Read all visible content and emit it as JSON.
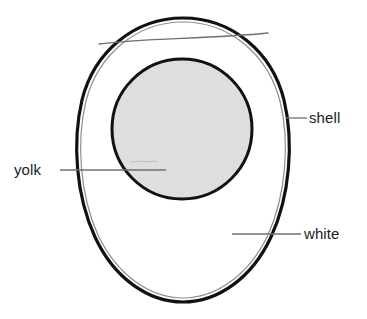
{
  "diagram": {
    "type": "labeled-illustration",
    "background_color": "#ffffff",
    "ink_color": "#1c1c1c",
    "parts": {
      "shell": {
        "label": "shell",
        "outline_color": "#111111",
        "outline_width": 3.2,
        "membrane_color": "#8d8d8d",
        "membrane_width": 1.1,
        "fill_color": "#ffffff"
      },
      "white": {
        "label": "white",
        "fill_color": "#ffffff"
      },
      "yolk": {
        "label": "yolk",
        "fill_color": "#dedede",
        "outline_color": "#111111",
        "outline_width": 3.0,
        "center_x": 182,
        "center_y": 129,
        "radius": 70
      },
      "air_cell": {
        "label": "air cell",
        "line_color": "#6f6f6f",
        "line_width": 1.2
      }
    },
    "leader_lines": {
      "color": "#6f6f6f",
      "width": 1.2
    },
    "labels": [
      {
        "id": "shell",
        "text": "shell",
        "x": 309,
        "y": 110
      },
      {
        "id": "white",
        "text": "white",
        "x": 304,
        "y": 226
      },
      {
        "id": "yolk",
        "text": "yolk",
        "x": 14,
        "y": 162
      }
    ]
  }
}
